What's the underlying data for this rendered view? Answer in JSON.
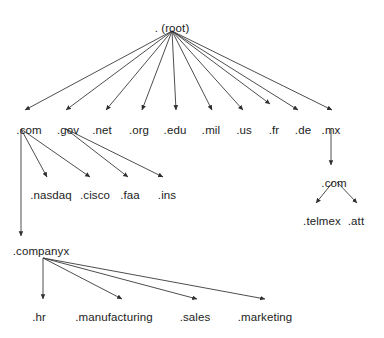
{
  "diagram": {
    "type": "tree-diagram",
    "background_color": "#ffffff",
    "text_color": "#1c1c1c",
    "edge_color": "#3a3a3a",
    "nodes": [
      {
        "id": "root",
        "label": ". (root)",
        "x": 172,
        "y": 22,
        "level": 0
      },
      {
        "id": "com",
        "label": ".com",
        "x": 29,
        "y": 124,
        "level": 1
      },
      {
        "id": "gov",
        "label": ".gov",
        "x": 68,
        "y": 124,
        "level": 1
      },
      {
        "id": "net",
        "label": ".net",
        "x": 102,
        "y": 124,
        "level": 1
      },
      {
        "id": "org",
        "label": ".org",
        "x": 139,
        "y": 124,
        "level": 1
      },
      {
        "id": "edu",
        "label": ".edu",
        "x": 175,
        "y": 124,
        "level": 1
      },
      {
        "id": "mil",
        "label": ".mil",
        "x": 211,
        "y": 124,
        "level": 1
      },
      {
        "id": "us",
        "label": ".us",
        "x": 244,
        "y": 124,
        "level": 1
      },
      {
        "id": "fr",
        "label": ".fr",
        "x": 274,
        "y": 124,
        "level": 1
      },
      {
        "id": "de",
        "label": ".de",
        "x": 303,
        "y": 124,
        "level": 1
      },
      {
        "id": "mx",
        "label": ".mx",
        "x": 331,
        "y": 124,
        "level": 1
      },
      {
        "id": "nasdaq",
        "label": ".nasdaq",
        "x": 51,
        "y": 189,
        "level": 2
      },
      {
        "id": "cisco",
        "label": ".cisco",
        "x": 95,
        "y": 189,
        "level": 2
      },
      {
        "id": "faa",
        "label": ".faa",
        "x": 130,
        "y": 189,
        "level": 2
      },
      {
        "id": "ins",
        "label": ".ins",
        "x": 167,
        "y": 189,
        "level": 2
      },
      {
        "id": "mx-com",
        "label": ".com",
        "x": 334,
        "y": 177,
        "level": 2
      },
      {
        "id": "telmex",
        "label": ".telmex",
        "x": 322,
        "y": 215,
        "level": 3
      },
      {
        "id": "att",
        "label": ".att",
        "x": 356,
        "y": 215,
        "level": 3
      },
      {
        "id": "companyx",
        "label": ".companyx",
        "x": 41,
        "y": 245,
        "level": 2
      },
      {
        "id": "hr",
        "label": ".hr",
        "x": 39,
        "y": 311,
        "level": 3
      },
      {
        "id": "manufacturing",
        "label": ".manufacturing",
        "x": 114,
        "y": 311,
        "level": 3
      },
      {
        "id": "sales",
        "label": ".sales",
        "x": 195,
        "y": 311,
        "level": 3
      },
      {
        "id": "marketing",
        "label": ".marketing",
        "x": 265,
        "y": 311,
        "level": 3
      }
    ],
    "edges": [
      {
        "from": "root",
        "to": "com",
        "x1": 172,
        "y1": 31,
        "x2": 25,
        "y2": 110
      },
      {
        "from": "root",
        "to": "gov",
        "x1": 172,
        "y1": 31,
        "x2": 66,
        "y2": 110
      },
      {
        "from": "root",
        "to": "net",
        "x1": 172,
        "y1": 31,
        "x2": 106,
        "y2": 110
      },
      {
        "from": "root",
        "to": "org",
        "x1": 172,
        "y1": 31,
        "x2": 142,
        "y2": 110
      },
      {
        "from": "root",
        "to": "edu",
        "x1": 172,
        "y1": 31,
        "x2": 176,
        "y2": 110
      },
      {
        "from": "root",
        "to": "mil",
        "x1": 172,
        "y1": 31,
        "x2": 212,
        "y2": 110
      },
      {
        "from": "root",
        "to": "us",
        "x1": 172,
        "y1": 31,
        "x2": 243,
        "y2": 110
      },
      {
        "from": "root",
        "to": "fr",
        "x1": 172,
        "y1": 31,
        "x2": 270,
        "y2": 104
      },
      {
        "from": "root",
        "to": "de",
        "x1": 172,
        "y1": 31,
        "x2": 298,
        "y2": 110
      },
      {
        "from": "root",
        "to": "mx",
        "x1": 172,
        "y1": 31,
        "x2": 332,
        "y2": 110
      },
      {
        "from": "com",
        "to": "nasdaq",
        "x1": 21,
        "y1": 129,
        "x2": 47,
        "y2": 177
      },
      {
        "from": "com",
        "to": "cisco",
        "x1": 21,
        "y1": 129,
        "x2": 90,
        "y2": 177
      },
      {
        "from": "gov",
        "to": "faa",
        "x1": 66,
        "y1": 129,
        "x2": 128,
        "y2": 177
      },
      {
        "from": "gov",
        "to": "ins",
        "x1": 66,
        "y1": 129,
        "x2": 163,
        "y2": 177
      },
      {
        "from": "com",
        "to": "companyx",
        "x1": 21,
        "y1": 129,
        "x2": 21,
        "y2": 236
      },
      {
        "from": "mx",
        "to": "mx-com",
        "x1": 331,
        "y1": 129,
        "x2": 331,
        "y2": 165
      },
      {
        "from": "mx-com",
        "to": "telmex",
        "x1": 333,
        "y1": 182,
        "x2": 316,
        "y2": 203
      },
      {
        "from": "mx-com",
        "to": "att",
        "x1": 337,
        "y1": 182,
        "x2": 357,
        "y2": 203
      },
      {
        "from": "companyx",
        "to": "hr",
        "x1": 43,
        "y1": 258,
        "x2": 43,
        "y2": 299
      },
      {
        "from": "companyx",
        "to": "manufacturing",
        "x1": 43,
        "y1": 258,
        "x2": 122,
        "y2": 299
      },
      {
        "from": "companyx",
        "to": "sales",
        "x1": 43,
        "y1": 258,
        "x2": 197,
        "y2": 299
      },
      {
        "from": "companyx",
        "to": "marketing",
        "x1": 43,
        "y1": 258,
        "x2": 265,
        "y2": 299
      }
    ]
  }
}
